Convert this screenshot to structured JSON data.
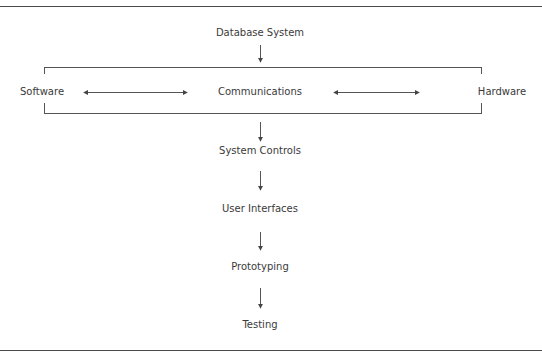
{
  "diagram": {
    "top_node": {
      "label": "Database System"
    },
    "group": {
      "left": {
        "label": "Software"
      },
      "center": {
        "label": "Communications"
      },
      "right": {
        "label": "Hardware"
      }
    },
    "sequence": [
      {
        "label": "System Controls"
      },
      {
        "label": "User Interfaces"
      },
      {
        "label": "Prototyping"
      },
      {
        "label": "Testing"
      }
    ],
    "colors": {
      "text": "#3a3a3a",
      "lines": "#555555",
      "rules": "#4a4a4a",
      "background": "#ffffff"
    }
  }
}
